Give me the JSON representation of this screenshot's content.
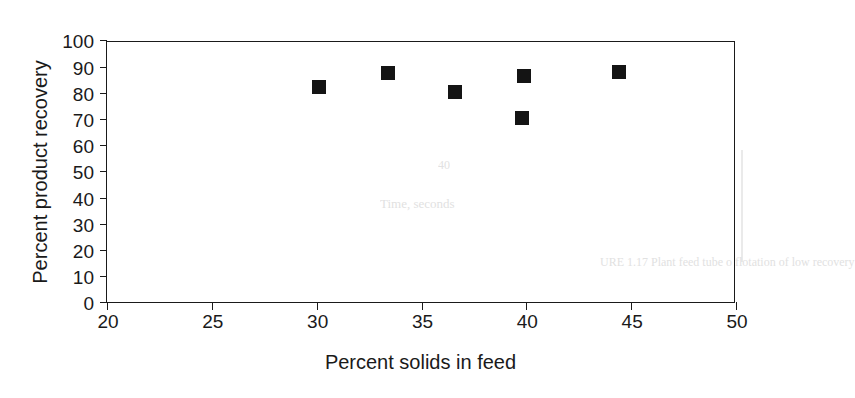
{
  "chart_data": {
    "type": "scatter",
    "title": "",
    "xlabel": "Percent solids in feed",
    "ylabel": "Percent product recovery",
    "xlim": [
      20,
      50
    ],
    "ylim": [
      0,
      100
    ],
    "xticks": [
      20,
      25,
      30,
      35,
      40,
      45,
      50
    ],
    "yticks": [
      0,
      10,
      20,
      30,
      40,
      50,
      60,
      70,
      80,
      90,
      100
    ],
    "xtick_labels": [
      "20",
      "25",
      "30",
      "35",
      "40",
      "45",
      "50"
    ],
    "ytick_labels": [
      "0",
      "10",
      "20",
      "30",
      "40",
      "50",
      "60",
      "70",
      "80",
      "90",
      "100"
    ],
    "grid": false,
    "legend": null,
    "marker_style": "filled-square",
    "marker_color": "#141414",
    "points": [
      {
        "x": 30.1,
        "y": 83.0
      },
      {
        "x": 33.4,
        "y": 88.0
      },
      {
        "x": 36.6,
        "y": 81.0
      },
      {
        "x": 39.8,
        "y": 71.0
      },
      {
        "x": 39.9,
        "y": 87.0
      },
      {
        "x": 44.4,
        "y": 88.5
      }
    ],
    "series": [
      {
        "name": "",
        "x": [
          30.1,
          33.4,
          36.6,
          39.8,
          39.9,
          44.4
        ],
        "values": [
          83.0,
          88.0,
          81.0,
          71.0,
          87.0,
          88.5
        ]
      }
    ]
  },
  "artifacts": {
    "caption_fragment": "URE 1.17  Plant  feed  tube  o  flotation  of  low  recovery",
    "mid_fragment": "Time, seconds",
    "tick_fragment": "40"
  }
}
